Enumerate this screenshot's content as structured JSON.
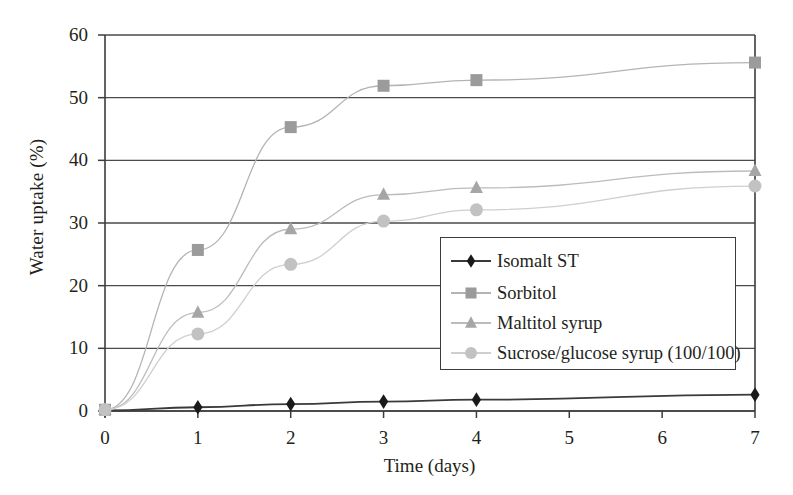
{
  "chart_data": {
    "type": "line",
    "title": "",
    "xlabel": "Time (days)",
    "ylabel": "Water uptake (%)",
    "x": [
      0,
      1,
      2,
      3,
      4,
      7
    ],
    "xlim": [
      0,
      7
    ],
    "ylim": [
      0,
      60
    ],
    "xticks": [
      "0",
      "1",
      "2",
      "3",
      "4",
      "5",
      "6",
      "7"
    ],
    "yticks": [
      "0",
      "10",
      "20",
      "30",
      "40",
      "50",
      "60"
    ],
    "grid": "horizontal",
    "legend_position": "center-right-inside",
    "series": [
      {
        "name": "Isomalt ST",
        "marker": "diamond",
        "color": "#1a1a1a",
        "line_color": "#3a3a3a",
        "values": [
          0.1,
          0.6,
          1.1,
          1.5,
          1.8,
          2.6
        ]
      },
      {
        "name": "Sorbitol",
        "marker": "square",
        "color": "#9b9b9b",
        "line_color": "#b4b4b4",
        "values": [
          0.2,
          25.7,
          45.3,
          51.9,
          52.8,
          55.6
        ]
      },
      {
        "name": "Maltitol syrup",
        "marker": "triangle",
        "color": "#a6a6a6",
        "line_color": "#bcbcbc",
        "values": [
          0.2,
          15.7,
          29.0,
          34.5,
          35.6,
          38.3
        ]
      },
      {
        "name": "Sucrose/glucose syrup (100/100)",
        "marker": "circle",
        "color": "#c2c2c2",
        "line_color": "#cfcfcf",
        "values": [
          0.2,
          12.3,
          23.4,
          30.3,
          32.1,
          35.9
        ]
      }
    ]
  },
  "axes": {
    "ylabel": "Water uptake (%)",
    "xlabel": "Time (days)",
    "yticks": [
      "60",
      "50",
      "40",
      "30",
      "20",
      "10",
      "0"
    ],
    "xticks": [
      "0",
      "1",
      "2",
      "3",
      "4",
      "5",
      "6",
      "7"
    ]
  },
  "legend": {
    "items": [
      {
        "label": "Isomalt ST",
        "marker": "diamond-marker-icon",
        "color": "#1a1a1a",
        "showline": true
      },
      {
        "label": "Sorbitol",
        "marker": "square-marker-icon",
        "color": "#9b9b9b",
        "showline": true
      },
      {
        "label": "Maltitol syrup",
        "marker": "triangle-marker-icon",
        "color": "#a6a6a6",
        "showline": true
      },
      {
        "label": "Sucrose/glucose syrup (100/100)",
        "marker": "circle-marker-icon",
        "color": "#c2c2c2",
        "showline": true
      }
    ]
  },
  "colors": {
    "axis": "#3c3c3c",
    "grid": "#4a4a4a",
    "background": "#ffffff",
    "text": "#231f20"
  }
}
